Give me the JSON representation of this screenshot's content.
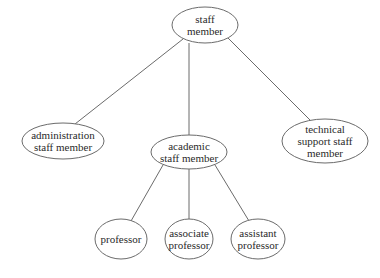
{
  "diagram": {
    "type": "tree",
    "nodes": [
      {
        "id": "staff",
        "lines": [
          "staff",
          "member"
        ],
        "cx": 205,
        "cy": 25,
        "rx": 33,
        "ry": 18
      },
      {
        "id": "admin",
        "lines": [
          "administration",
          "staff member"
        ],
        "cx": 63,
        "cy": 141,
        "rx": 41,
        "ry": 18
      },
      {
        "id": "academic",
        "lines": [
          "academic",
          "staff member"
        ],
        "cx": 189,
        "cy": 152,
        "rx": 38,
        "ry": 17
      },
      {
        "id": "technical",
        "lines": [
          "technical",
          "support staff",
          "member"
        ],
        "cx": 325,
        "cy": 141,
        "rx": 43,
        "ry": 22
      },
      {
        "id": "professor",
        "lines": [
          "professor"
        ],
        "cx": 121,
        "cy": 239,
        "rx": 26,
        "ry": 20
      },
      {
        "id": "associate",
        "lines": [
          "associate",
          "professor"
        ],
        "cx": 189,
        "cy": 239,
        "rx": 24,
        "ry": 20
      },
      {
        "id": "assistant",
        "lines": [
          "assistant",
          "professor"
        ],
        "cx": 258,
        "cy": 239,
        "rx": 27,
        "ry": 20
      }
    ],
    "edges": [
      {
        "from": "staff",
        "to": "admin",
        "x1": 183,
        "y1": 39,
        "x2": 75,
        "y2": 124
      },
      {
        "from": "staff",
        "to": "academic",
        "x1": 189,
        "y1": 43,
        "x2": 189,
        "y2": 135
      },
      {
        "from": "staff",
        "to": "technical",
        "x1": 228,
        "y1": 38,
        "x2": 310,
        "y2": 120
      },
      {
        "from": "academic",
        "to": "professor",
        "x1": 163,
        "y1": 165,
        "x2": 131,
        "y2": 221
      },
      {
        "from": "academic",
        "to": "associate",
        "x1": 189,
        "y1": 169,
        "x2": 189,
        "y2": 219
      },
      {
        "from": "academic",
        "to": "assistant",
        "x1": 215,
        "y1": 165,
        "x2": 249,
        "y2": 221
      }
    ]
  }
}
